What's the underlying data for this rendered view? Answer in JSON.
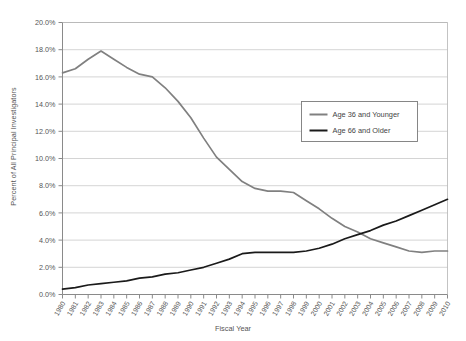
{
  "chart_data": {
    "type": "line",
    "title": "",
    "xlabel": "Fiscal Year",
    "ylabel": "Percent of All Principal Investigators",
    "xlim": [
      1980,
      2010
    ],
    "ylim": [
      0,
      20
    ],
    "grid": true,
    "legend_position": "upper-right-inside",
    "y_tick_labels": [
      "0.0%",
      "2.0%",
      "4.0%",
      "6.0%",
      "8.0%",
      "10.0%",
      "12.0%",
      "14.0%",
      "16.0%",
      "18.0%",
      "20.0%"
    ],
    "y_tick_values": [
      0,
      2,
      4,
      6,
      8,
      10,
      12,
      14,
      16,
      18,
      20
    ],
    "categories": [
      "1980",
      "1981",
      "1982",
      "1983",
      "1984",
      "1985",
      "1986",
      "1987",
      "1988",
      "1989",
      "1990",
      "1991",
      "1992",
      "1993",
      "1994",
      "1995",
      "1996",
      "1997",
      "1998",
      "1999",
      "2000",
      "2001",
      "2002",
      "2003",
      "2004",
      "2005",
      "2006",
      "2007",
      "2008",
      "2009",
      "2010"
    ],
    "series": [
      {
        "name": "Age 36 and Younger",
        "color": "#808080",
        "values": [
          16.3,
          16.6,
          17.3,
          17.9,
          17.3,
          16.7,
          16.2,
          16.0,
          15.2,
          14.2,
          13.0,
          11.5,
          10.1,
          9.2,
          8.3,
          7.8,
          7.6,
          7.6,
          7.5,
          6.9,
          6.3,
          5.6,
          5.0,
          4.6,
          4.1,
          3.8,
          3.5,
          3.2,
          3.1,
          3.2,
          3.2
        ]
      },
      {
        "name": "Age 66 and Older",
        "color": "#1a1a1a",
        "values": [
          0.4,
          0.5,
          0.7,
          0.8,
          0.9,
          1.0,
          1.2,
          1.3,
          1.5,
          1.6,
          1.8,
          2.0,
          2.3,
          2.6,
          3.0,
          3.1,
          3.1,
          3.1,
          3.1,
          3.2,
          3.4,
          3.7,
          4.1,
          4.4,
          4.7,
          5.1,
          5.4,
          5.8,
          6.2,
          6.6,
          7.0
        ]
      }
    ],
    "legend": [
      {
        "label": "Age 36 and Younger",
        "color": "#808080"
      },
      {
        "label": "Age 66 and Older",
        "color": "#1a1a1a"
      }
    ]
  }
}
